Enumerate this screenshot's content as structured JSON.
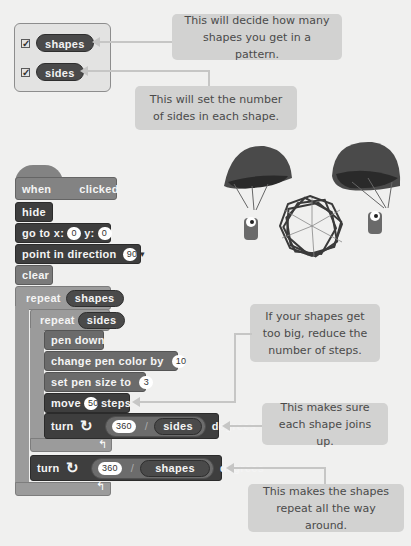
{
  "variables": {
    "items": [
      {
        "name": "shapes",
        "checked": true
      },
      {
        "name": "sides",
        "checked": true
      }
    ]
  },
  "callouts": {
    "shapes_count": "This will decide how many shapes you get in a pattern.",
    "sides_count": "This will set the number of sides in each shape.",
    "steps": "If your shapes get too big, reduce the number of steps.",
    "joins": "This makes sure each shape joins up.",
    "around": "This makes the shapes repeat all the way around."
  },
  "script": {
    "when": "when",
    "clicked": "clicked",
    "hide": "hide",
    "goto_label": "go to x:",
    "goto_x": "0",
    "goto_y_label": "y:",
    "goto_y": "0",
    "point_label": "point in direction",
    "point_value": "90",
    "clear": "clear",
    "repeat_label": "repeat",
    "repeat_outer_var": "shapes",
    "repeat_inner_var": "sides",
    "pen_down": "pen down",
    "change_pen_label": "change pen color by",
    "change_pen_value": "10",
    "pen_size_label": "set pen size to",
    "pen_size_value": "3",
    "move_label": "move",
    "move_value": "50",
    "steps_label": "steps",
    "turn_label": "turn",
    "turn_inner_num": "360",
    "turn_inner_div": "/",
    "turn_inner_var": "sides",
    "degrees": "degrees",
    "turn_outer_num": "360",
    "turn_outer_div": "/",
    "turn_outer_var": "shapes"
  },
  "illustration": {
    "description": "Two cat sprites with parachutes beside a spirograph polygon pattern"
  }
}
